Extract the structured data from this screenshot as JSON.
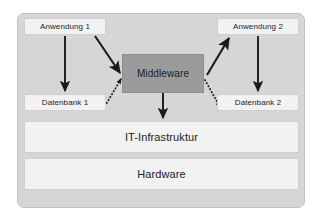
{
  "diagram": {
    "title_text": "",
    "colors": {
      "canvas": "#ffffff",
      "frame_fill": "#d6d6d6",
      "frame_border": "#c2c2c2",
      "node_fill": "#f2f2f2",
      "node_border": "#cfcfcf",
      "middleware_fill": "#9b9b9b",
      "middleware_border": "#8d8d8d",
      "arrow": "#1a1a1a",
      "text": "#1c1c1c"
    },
    "nodes": {
      "app1": {
        "label": "Anwendung 1"
      },
      "app2": {
        "label": "Anwendung 2"
      },
      "middleware": {
        "label": "Middleware"
      },
      "db1": {
        "label": "Datenbank 1"
      },
      "db2": {
        "label": "Datenbank 2"
      },
      "it_infrastructure": {
        "label": "IT-Infrastruktur"
      },
      "hardware": {
        "label": "Hardware"
      }
    },
    "edges": [
      {
        "id": "app1-to-db1",
        "from": "app1",
        "to": "db1",
        "style": "solid",
        "direction": "down"
      },
      {
        "id": "app2-to-db2",
        "from": "app2",
        "to": "db2",
        "style": "solid",
        "direction": "down"
      },
      {
        "id": "app1-to-middleware",
        "from": "app1",
        "to": "middleware",
        "style": "solid",
        "direction": "down-right"
      },
      {
        "id": "middleware-to-app2",
        "from": "middleware",
        "to": "app2",
        "style": "solid",
        "direction": "up-right"
      },
      {
        "id": "db1-to-middleware",
        "from": "db1",
        "to": "middleware",
        "style": "dotted",
        "direction": "up-right"
      },
      {
        "id": "middleware-to-db2",
        "from": "middleware",
        "to": "db2",
        "style": "dotted",
        "direction": "down-right"
      },
      {
        "id": "middleware-to-it-infrastructure",
        "from": "middleware",
        "to": "it_infrastructure",
        "style": "solid",
        "direction": "down"
      }
    ]
  }
}
